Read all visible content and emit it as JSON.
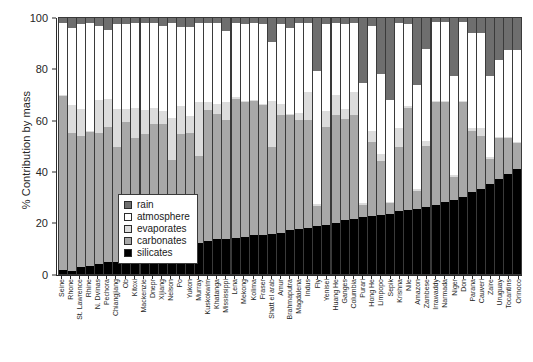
{
  "chart_data": {
    "type": "bar",
    "subtype": "stacked-bar-100-percent",
    "title": "",
    "xlabel": "",
    "ylabel": "% Contribution by mass",
    "ylim": [
      0,
      100
    ],
    "yticks": [
      0,
      20,
      40,
      60,
      80,
      100
    ],
    "ytick_labels": [
      "0",
      "20",
      "40",
      "60",
      "80",
      "100"
    ],
    "grid": false,
    "legend_position": "inside-left-middle",
    "stack_order_bottom_to_top": [
      "silicates",
      "carbonates",
      "evaporates",
      "atmosphere",
      "rain"
    ],
    "legend": [
      {
        "label": "rain",
        "color": "#6e6e6e"
      },
      {
        "label": "atmosphere",
        "color": "#ffffff"
      },
      {
        "label": "evaporates",
        "color": "#dcdcdc"
      },
      {
        "label": "carbonates",
        "color": "#a8a8a8"
      },
      {
        "label": "silicates",
        "color": "#000000"
      }
    ],
    "categories": [
      "Seine",
      "Rhone",
      "St. Lawrence",
      "Rhine",
      "N. Dvinas",
      "Pechora",
      "Chiangjiang",
      "Ob",
      "Kitoxi",
      "Mackenzie",
      "Dnepr",
      "Xijiang",
      "Nelson",
      "Po",
      "Yukon",
      "Murray",
      "Kuskokwim",
      "Khatanga",
      "Mississippi",
      "Lena",
      "Mekong",
      "Kolima",
      "Fraser",
      "Shatt el arab",
      "Amur",
      "Brahmaputra",
      "Magdalena",
      "Indus",
      "Fly",
      "Yenisei",
      "Huang He",
      "Ganges",
      "Columbia",
      "Purari",
      "Hong He",
      "Limpopo",
      "Sepik",
      "Krishna",
      "Nile",
      "Amazon",
      "Zambese",
      "Irrawaddy",
      "Narmada",
      "Niger",
      "Don",
      "Parana",
      "Cauveri",
      "Zaire",
      "Uruguay",
      "Tocantins",
      "Orinoco"
    ],
    "series": [
      {
        "name": "silicates",
        "color": "#000000",
        "values": [
          1.5,
          1.0,
          2.5,
          3.0,
          4.0,
          4.5,
          4.5,
          5.0,
          5.5,
          6.5,
          7.5,
          8.0,
          8.5,
          9.5,
          11.0,
          12.0,
          13.0,
          13.5,
          13.5,
          14.0,
          14.5,
          15.0,
          15.0,
          15.5,
          16.0,
          17.0,
          17.5,
          18.0,
          18.5,
          19.0,
          20.0,
          21.0,
          21.5,
          22.0,
          22.5,
          23.0,
          23.5,
          24.5,
          25.0,
          25.5,
          26.0,
          27.0,
          28.0,
          29.0,
          30.0,
          32.0,
          33.0,
          35.0,
          37.0,
          39.0,
          41.0
        ]
      },
      {
        "name": "carbonates",
        "color": "#a8a8a8",
        "values": [
          68.0,
          54.0,
          51.5,
          52.5,
          51.0,
          53.0,
          45.0,
          54.5,
          47.5,
          48.0,
          51.0,
          50.5,
          36.0,
          45.0,
          44.0,
          34.0,
          51.0,
          49.0,
          46.5,
          54.5,
          52.5,
          52.5,
          51.0,
          34.0,
          46.0,
          45.0,
          42.5,
          42.0,
          8.0,
          38.5,
          42.0,
          39.5,
          40.5,
          5.0,
          29.0,
          21.0,
          4.0,
          25.0,
          40.0,
          7.0,
          24.0,
          40.0,
          39.0,
          9.0,
          37.0,
          24.0,
          21.0,
          10.0,
          16.0,
          14.0,
          10.0
        ]
      },
      {
        "name": "evaporates",
        "color": "#dcdcdc",
        "values": [
          0.5,
          11.0,
          10.5,
          0.5,
          13.0,
          11.0,
          15.0,
          5.0,
          12.0,
          9.5,
          6.5,
          5.0,
          16.5,
          11.0,
          6.5,
          21.0,
          3.0,
          4.0,
          7.0,
          0.5,
          0.5,
          0.5,
          0.5,
          18.0,
          4.5,
          0.5,
          3.0,
          11.0,
          0.5,
          6.0,
          8.0,
          4.0,
          9.0,
          0.5,
          4.5,
          3.0,
          0.5,
          7.5,
          0.5,
          0.5,
          2.0,
          0.5,
          0.5,
          0.5,
          0.5,
          1.0,
          3.0,
          0.5,
          0.5,
          0.5,
          0.5
        ]
      },
      {
        "name": "atmosphere",
        "color": "#ffffff",
        "values": [
          28.0,
          30.0,
          33.0,
          42.0,
          29.0,
          27.0,
          33.0,
          33.0,
          33.0,
          34.0,
          33.0,
          33.5,
          37.0,
          31.0,
          35.0,
          31.0,
          31.0,
          31.5,
          28.0,
          29.0,
          30.0,
          30.0,
          31.0,
          23.0,
          31.0,
          33.5,
          35.0,
          27.0,
          52.0,
          34.0,
          28.0,
          33.0,
          27.0,
          47.0,
          41.0,
          31.0,
          40.0,
          41.0,
          32.0,
          41.0,
          36.0,
          31.0,
          31.0,
          39.0,
          31.0,
          37.0,
          37.0,
          32.0,
          30.0,
          34.0,
          36.0
        ]
      },
      {
        "name": "rain",
        "color": "#6e6e6e",
        "values": [
          2.0,
          4.0,
          2.5,
          2.0,
          3.0,
          4.5,
          2.5,
          2.5,
          2.0,
          2.0,
          2.0,
          3.0,
          2.0,
          3.5,
          3.5,
          2.0,
          2.0,
          2.0,
          5.0,
          2.0,
          2.5,
          2.0,
          2.5,
          9.5,
          2.5,
          4.0,
          2.0,
          2.0,
          20.5,
          2.5,
          2.0,
          2.5,
          2.0,
          25.5,
          3.0,
          22.0,
          32.0,
          2.0,
          2.5,
          26.0,
          12.0,
          1.5,
          1.5,
          22.5,
          1.5,
          6.0,
          6.0,
          22.5,
          16.5,
          12.5,
          12.5
        ]
      }
    ]
  },
  "axis": {
    "y_title": "% Contribution by mass"
  }
}
